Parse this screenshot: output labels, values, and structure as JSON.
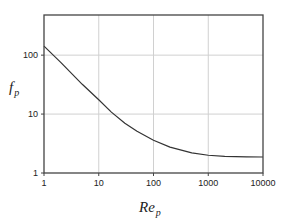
{
  "chart_data": {
    "type": "line",
    "title": "",
    "xlabel": "Re_p",
    "ylabel": "f_p",
    "xlabel_main": "Re",
    "xlabel_sub": "p",
    "ylabel_main": "f",
    "ylabel_sub": "p",
    "xscale": "log",
    "yscale": "log",
    "xlim": [
      1,
      10000
    ],
    "ylim": [
      1,
      480
    ],
    "grid": true,
    "legend": null,
    "x_ticks": [
      "1",
      "10",
      "100",
      "1000",
      "10000"
    ],
    "y_ticks": [
      "1",
      "10",
      "100"
    ],
    "series": [
      {
        "name": "f_p",
        "color": "#333333",
        "x": [
          1,
          2,
          5,
          10,
          17,
          30,
          50,
          100,
          200,
          500,
          1000,
          2000,
          5000,
          10000
        ],
        "y": [
          142,
          76,
          32,
          17.5,
          10.8,
          7.0,
          5.1,
          3.6,
          2.75,
          2.2,
          2.0,
          1.92,
          1.88,
          1.87
        ]
      }
    ]
  },
  "colors": {
    "frame": "#444444",
    "grid": "#d0d0d0",
    "line": "#333333"
  }
}
